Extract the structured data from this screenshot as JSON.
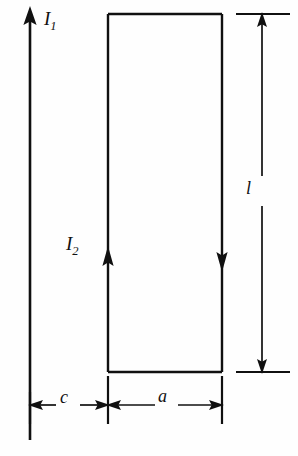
{
  "figure": {
    "type": "physics-diagram",
    "background_color": "#fefefe",
    "line_color": "#101010"
  },
  "labels": {
    "wire_current": {
      "symbol": "I",
      "subscript": "1",
      "name": "I1"
    },
    "loop_current": {
      "symbol": "I",
      "subscript": "2",
      "name": "I2"
    },
    "loop_height": {
      "symbol": "l",
      "name": "l"
    },
    "gap_distance": {
      "symbol": "c",
      "name": "c"
    },
    "loop_width": {
      "symbol": "a",
      "name": "a"
    }
  },
  "geometry": {
    "wire": {
      "x": 30,
      "y_top": 8,
      "y_bottom": 440,
      "direction": "up"
    },
    "loop": {
      "left": 108,
      "right": 222,
      "top": 14,
      "bottom": 372
    },
    "loop_left_arrow": {
      "x": 108,
      "y": 268,
      "direction": "up"
    },
    "loop_right_arrow": {
      "x": 222,
      "y": 262,
      "direction": "down"
    },
    "dimension_l": {
      "x": 262,
      "y_top": 14,
      "y_bottom": 372
    },
    "dimension_c": {
      "y": 405,
      "x_left": 30,
      "x_right": 108
    },
    "dimension_a": {
      "y": 405,
      "x_left": 108,
      "x_right": 222
    }
  }
}
